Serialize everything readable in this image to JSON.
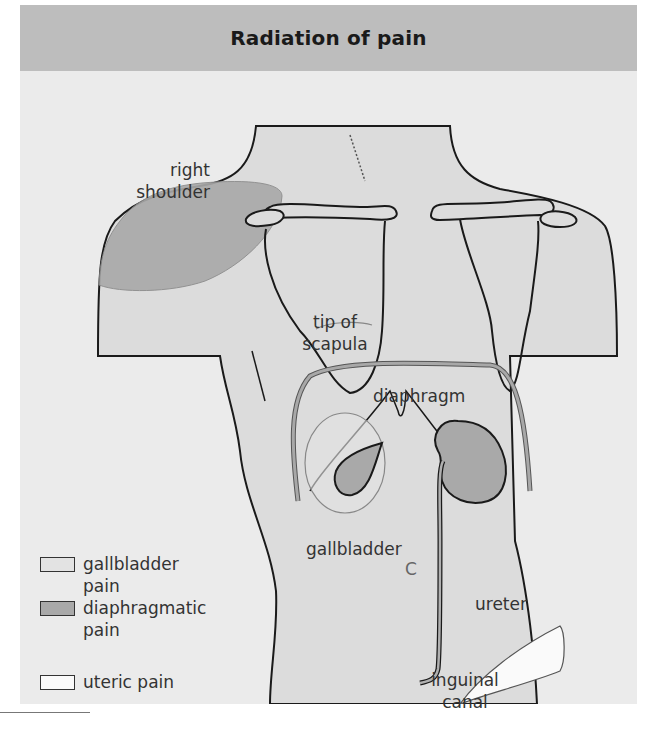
{
  "header": {
    "title": "Radiation of pain"
  },
  "labels": {
    "right_shoulder": [
      "right",
      "shoulder"
    ],
    "tip_of_scapula": [
      "tip of",
      "scapula"
    ],
    "diaphragm": "diaphragm",
    "gallbladder": "gallbladder",
    "ureter": "ureter",
    "inguinal_canal": [
      "inguinal",
      "canal"
    ],
    "c_mark": "C"
  },
  "legend": {
    "items": [
      {
        "label_lines": [
          "gallbladder pain"
        ],
        "color": "#e3e3e3"
      },
      {
        "label_lines": [
          "diaphragmatic",
          "pain"
        ],
        "color": "#a9a9a9"
      },
      {
        "label_lines": [
          "uteric pain"
        ],
        "color": "#fafafa"
      }
    ]
  },
  "colors": {
    "header_bg": "#bdbdbd",
    "panel_bg": "#ebebeb",
    "body_fill": "#dcdcdc",
    "diaphragm_band": "#9e9e9e",
    "organ_fill": "#a9a9a9",
    "outline": "#1a1a1a"
  }
}
